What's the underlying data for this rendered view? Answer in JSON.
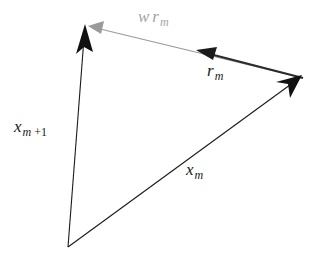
{
  "figure": {
    "name": "vector-addition-diagram",
    "background_color": "#ffffff",
    "width": 320,
    "height": 271
  },
  "colors": {
    "stroke_dark": "#1a1a1a",
    "stroke_gray": "#a3a3a3",
    "arrow_dark": "#111111",
    "arrow_gray": "#9a9a9a",
    "background": "#ffffff"
  },
  "vectors": [
    {
      "id": "x-m-plus-1",
      "label": "x_{m+1}",
      "color": "#1a1a1a",
      "from": {
        "x": 68,
        "y": 247
      },
      "to": {
        "x": 85,
        "y": 24
      },
      "arrowhead": "at-tip",
      "stroke_width": 1.1
    },
    {
      "id": "x-m",
      "label": "x_m",
      "color": "#1a1a1a",
      "from": {
        "x": 68,
        "y": 247
      },
      "to": {
        "x": 302,
        "y": 76
      },
      "arrowhead": "at-tip",
      "stroke_width": 1.1
    },
    {
      "id": "w-r-m",
      "label": "w r_m",
      "color": "#9a9a9a",
      "from": {
        "x": 303,
        "y": 78
      },
      "to": {
        "x": 88,
        "y": 26
      },
      "arrowhead": "at-tip",
      "stroke_width": 1.2
    },
    {
      "id": "r-m",
      "label": "r_m",
      "color": "#2b2b2b",
      "from": {
        "x": 303,
        "y": 78
      },
      "to": {
        "x": 196,
        "y": 50
      },
      "arrowhead": "at-tip",
      "stroke_width": 2.0
    }
  ],
  "labels": {
    "w_r_m": {
      "base1": "w",
      "base2": "r",
      "sub": "m"
    },
    "r_m": {
      "base": "r",
      "sub": "m"
    },
    "x_m_plus_1": {
      "base": "x",
      "sub": "m",
      "sub_plus": "+1"
    },
    "x_m": {
      "base": "x",
      "sub": "m"
    }
  }
}
